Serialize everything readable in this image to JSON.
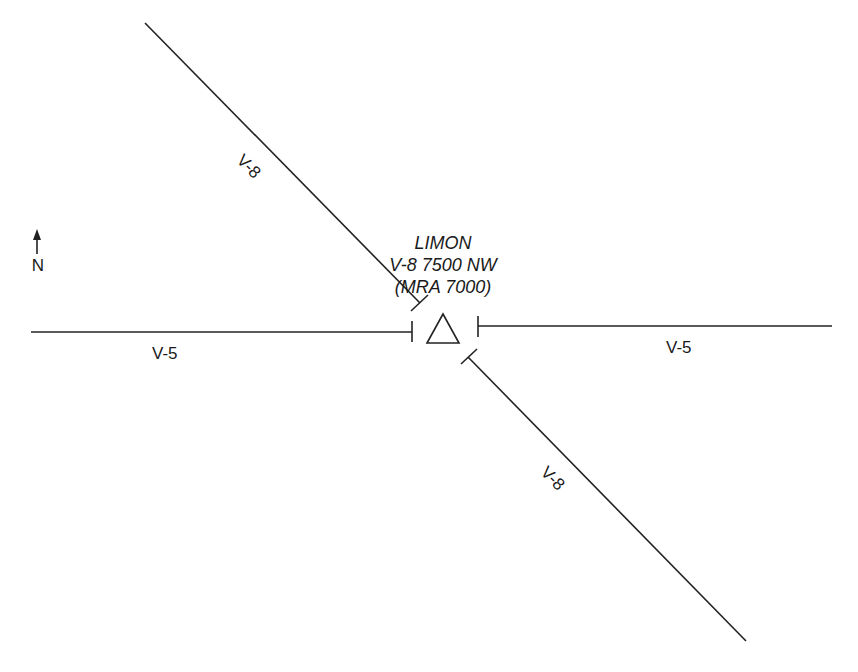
{
  "station": {
    "name": "LIMON",
    "altitude_line": "V-8 7500 NW",
    "mra_line": "(MRA 7000)",
    "symbol": "triangle-icon"
  },
  "airways": [
    {
      "id": "V-8",
      "segment": "northwest",
      "label": "V-8"
    },
    {
      "id": "V-5",
      "segment": "west",
      "label": "V-5"
    },
    {
      "id": "V-5",
      "segment": "east",
      "label": "V-5"
    },
    {
      "id": "V-8",
      "segment": "southeast",
      "label": "V-8"
    }
  ],
  "north_arrow": {
    "label": "N",
    "icon": "north-arrow-icon"
  },
  "colors": {
    "line": "#222222",
    "text": "#1a1a1a",
    "background": "#ffffff"
  }
}
